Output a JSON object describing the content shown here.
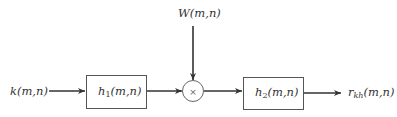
{
  "diagram": {
    "type": "block-diagram",
    "input": {
      "label": "k(m,n)",
      "base": "k",
      "args": "(m,n)"
    },
    "weight": {
      "label": "W(m,n)",
      "base": "W",
      "args": "(m,n)"
    },
    "blocks": [
      {
        "id": "h1",
        "label": "h1(m,n)",
        "base": "h",
        "sub": "1",
        "args": "(m,n)"
      },
      {
        "id": "h2",
        "label": "h2(m,n)",
        "base": "h",
        "sub": "2",
        "args": "(m,n)"
      }
    ],
    "multiplier": {
      "symbol": "×"
    },
    "output": {
      "label": "rkh(m,n)",
      "base": "r",
      "sub": "kh",
      "args": "(m,n)"
    },
    "edges": [
      {
        "from": "k(m,n)",
        "to": "h1"
      },
      {
        "from": "h1",
        "to": "multiplier"
      },
      {
        "from": "W(m,n)",
        "to": "multiplier"
      },
      {
        "from": "multiplier",
        "to": "h2"
      },
      {
        "from": "h2",
        "to": "rkh(m,n)"
      }
    ]
  }
}
